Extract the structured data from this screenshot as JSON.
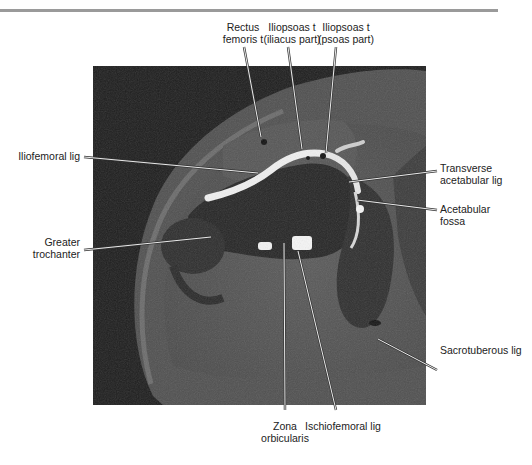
{
  "figure": {
    "image_tones": {
      "background": "#1c1c1c",
      "tissue": "#555555",
      "bone": "#2a2a2a",
      "contrast": "#f2f2f2"
    }
  },
  "labels": {
    "rectus_femoris": {
      "line1": "Rectus",
      "line2": "femoris t"
    },
    "iliopsoas_iliacus": {
      "line1": "Iliopsoas t",
      "line2": "(iliacus part)"
    },
    "iliopsoas_psoas": {
      "line1": "Iliopsoas t",
      "line2": "(psoas part)"
    },
    "iliofemoral": {
      "line1": "Iliofemoral lig"
    },
    "transverse_acetabular": {
      "line1": "Transverse",
      "line2": "acetabular lig"
    },
    "acetabular_fossa": {
      "line1": "Acetabular",
      "line2": "fossa"
    },
    "greater_trochanter": {
      "line1": "Greater",
      "line2": "trochanter"
    },
    "sacrotuberous": {
      "line1": "Sacrotuberous lig"
    },
    "zona_orbicularis": {
      "line1": "Zona",
      "line2": "orbicularis"
    },
    "ischiofemoral": {
      "line1": "Ischiofemoral lig"
    }
  }
}
